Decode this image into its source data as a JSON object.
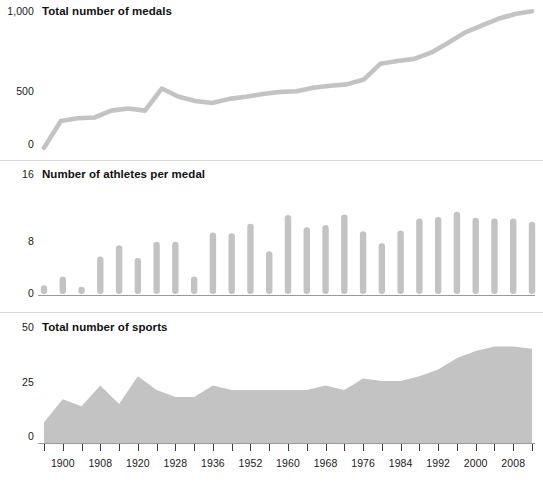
{
  "figure": {
    "background": "#ffffff",
    "series_color": "#c3c3c3",
    "axis_color": "#9a9a9a",
    "tick_color": "#3b3b3b",
    "text_color": "#1a1a1a"
  },
  "panels": [
    {
      "id": "medals",
      "title": "Total number of medals",
      "ymax_label": "1,000",
      "ymid_label": "500",
      "ymin_label": "0"
    },
    {
      "id": "athletes",
      "title": "Number of athletes per medal",
      "ymax_label": "16",
      "ymid_label": "8",
      "ymin_label": "0"
    },
    {
      "id": "sports",
      "title": "Total number of sports",
      "ymax_label": "50",
      "ymid_label": "25",
      "ymin_label": "0"
    }
  ],
  "xaxis": {
    "years": [
      1896,
      1900,
      1904,
      1908,
      1912,
      1920,
      1924,
      1928,
      1932,
      1936,
      1948,
      1952,
      1956,
      1960,
      1964,
      1968,
      1972,
      1976,
      1980,
      1984,
      1988,
      1992,
      1996,
      2000,
      2004,
      2008,
      2012
    ],
    "labels": [
      {
        "year": 1900,
        "text": "1900"
      },
      {
        "year": 1908,
        "text": "1908"
      },
      {
        "year": 1920,
        "text": "1920"
      },
      {
        "year": 1928,
        "text": "1928"
      },
      {
        "year": 1936,
        "text": "1936"
      },
      {
        "year": 1952,
        "text": "1952"
      },
      {
        "year": 1960,
        "text": "1960"
      },
      {
        "year": 1968,
        "text": "1968"
      },
      {
        "year": 1976,
        "text": "1976"
      },
      {
        "year": 1984,
        "text": "1984"
      },
      {
        "year": 1992,
        "text": "1992"
      },
      {
        "year": 2000,
        "text": "2000"
      },
      {
        "year": 2008,
        "text": "2008"
      }
    ]
  },
  "chart_data": [
    {
      "type": "line",
      "title": "Total number of medals",
      "xlabel": "",
      "ylabel": "",
      "ylim": [
        0,
        1000
      ],
      "yticks": [
        0,
        500,
        1000
      ],
      "grid": false,
      "legend": "none",
      "x": [
        1896,
        1900,
        1904,
        1908,
        1912,
        1920,
        1924,
        1928,
        1932,
        1936,
        1948,
        1952,
        1956,
        1960,
        1964,
        1968,
        1972,
        1976,
        1980,
        1984,
        1988,
        1992,
        1996,
        2000,
        2004,
        2008,
        2012
      ],
      "values": [
        30,
        225,
        245,
        250,
        300,
        315,
        300,
        460,
        400,
        370,
        355,
        385,
        400,
        420,
        435,
        440,
        465,
        480,
        490,
        525,
        640,
        660,
        675,
        720,
        790,
        865,
        915,
        965,
        1000,
        1020
      ]
    },
    {
      "type": "bar",
      "title": "Number of athletes per medal",
      "xlabel": "",
      "ylabel": "",
      "ylim": [
        0,
        16
      ],
      "yticks": [
        0,
        8,
        16
      ],
      "grid": false,
      "legend": "none",
      "categories": [
        1896,
        1900,
        1904,
        1908,
        1912,
        1920,
        1924,
        1928,
        1932,
        1936,
        1948,
        1952,
        1956,
        1960,
        1964,
        1968,
        1972,
        1976,
        1980,
        1984,
        1988,
        1992,
        1996,
        2000,
        2004,
        2008,
        2012
      ],
      "values": [
        1.3,
        2.6,
        1.1,
        5.6,
        7.3,
        5.4,
        7.8,
        7.8,
        2.6,
        9.2,
        9.1,
        10.5,
        6.4,
        11.8,
        10.0,
        10.3,
        11.9,
        9.4,
        7.6,
        9.5,
        11.3,
        11.5,
        12.3,
        11.4,
        11.3,
        11.3,
        10.8
      ]
    },
    {
      "type": "area",
      "title": "Total number of sports",
      "xlabel": "",
      "ylabel": "",
      "ylim": [
        0,
        50
      ],
      "yticks": [
        0,
        25,
        50
      ],
      "grid": false,
      "legend": "none",
      "x": [
        1896,
        1900,
        1904,
        1908,
        1912,
        1920,
        1924,
        1928,
        1932,
        1936,
        1948,
        1952,
        1956,
        1960,
        1964,
        1968,
        1972,
        1976,
        1980,
        1984,
        1988,
        1992,
        1996,
        2000,
        2004,
        2008,
        2012
      ],
      "values": [
        9,
        19,
        16,
        25,
        17,
        29,
        23,
        20,
        20,
        25,
        23,
        23,
        23,
        23,
        23,
        25,
        23,
        28,
        27,
        27,
        29,
        32,
        37,
        40,
        42,
        42,
        41
      ]
    }
  ]
}
